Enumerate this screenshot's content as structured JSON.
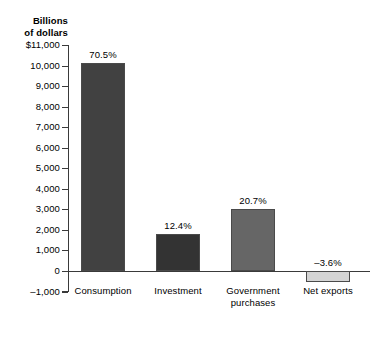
{
  "chart_data": {
    "type": "bar",
    "title": "",
    "subtitle": "",
    "xlabel": "",
    "ylabel": "Billions\nof dollars",
    "ylabel_lines": [
      "Billions",
      "of dollars"
    ],
    "categories": [
      "Consumption",
      "Investment",
      "Government purchases",
      "Net exports"
    ],
    "category_label_lines": [
      [
        "Consumption"
      ],
      [
        "Investment"
      ],
      [
        "Government",
        "purchases"
      ],
      [
        "Net exports"
      ]
    ],
    "values": [
      10140,
      1800,
      3000,
      -520
    ],
    "data_labels": [
      "70.5%",
      "12.4%",
      "20.7%",
      "–3.6%"
    ],
    "bar_colors": [
      "#414141",
      "#333333",
      "#666666",
      "#d4d4d4"
    ],
    "bar_border_color": "#4a4a4a",
    "ylim": [
      -1000,
      11000
    ],
    "ytick_values": [
      11000,
      10000,
      9000,
      8000,
      7000,
      6000,
      5000,
      4000,
      3000,
      2000,
      1000,
      0,
      -1000
    ],
    "ytick_labels": [
      "$11,000",
      "10,000",
      "9,000",
      "8,000",
      "7,000",
      "6,000",
      "5,000",
      "4,000",
      "3,000",
      "2,000",
      "1,000",
      "0",
      "–1,000"
    ],
    "grid": false,
    "legend": false,
    "legend_position": "none",
    "axis_color": "#3a3a3a",
    "background_color": "#ffffff"
  }
}
